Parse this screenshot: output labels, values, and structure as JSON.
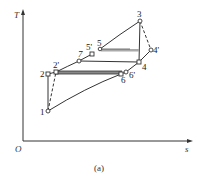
{
  "diagram": {
    "type": "T-s diagram",
    "caption": "(a)",
    "axes": {
      "y_label": "T",
      "x_label": "s",
      "origin_label": "O"
    },
    "points": [
      {
        "id": "1",
        "label": "1"
      },
      {
        "id": "2",
        "label": "2"
      },
      {
        "id": "2p",
        "label": "2'"
      },
      {
        "id": "7",
        "label": "7"
      },
      {
        "id": "5p",
        "label": "5'"
      },
      {
        "id": "5",
        "label": "5"
      },
      {
        "id": "3",
        "label": "3"
      },
      {
        "id": "4p",
        "label": "4'"
      },
      {
        "id": "4",
        "label": "4"
      },
      {
        "id": "6",
        "label": "6"
      },
      {
        "id": "6p",
        "label": "6'"
      }
    ],
    "colors": {
      "line": "#333333",
      "regenerator_band": "#888888",
      "background": "#ffffff"
    }
  }
}
